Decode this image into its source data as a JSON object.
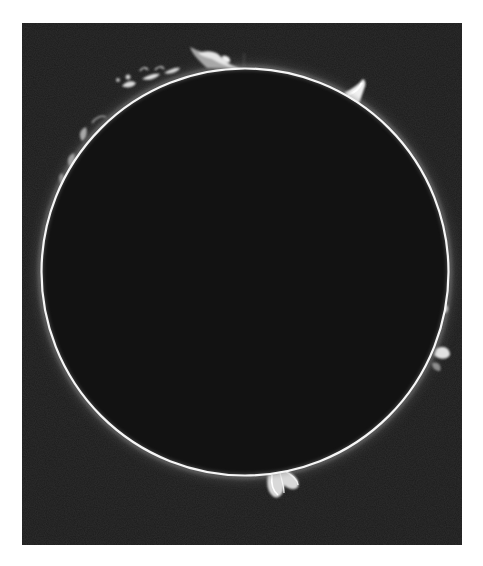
{
  "image": {
    "subject": "Solar disk with limb prominences",
    "alt": "Black-and-white photograph of the Sun's disk as a dark circle outlined by a bright thin limb, with several bright prominences erupting from the edge"
  },
  "colors": {
    "page_background": "#ffffff",
    "sky_background": "#1c1c1c",
    "disk_fill": "#111111",
    "limb": "#f4f4f4",
    "prominence": "#e8e8e8"
  },
  "geometry": {
    "frame": {
      "x": 22,
      "y": 23,
      "width": 440,
      "height": 522
    },
    "disk": {
      "cx": 223,
      "cy": 249,
      "r": 203
    }
  },
  "prominences": [
    {
      "name": "top-left-plume",
      "position": "upper limb near top, left of center"
    },
    {
      "name": "upper-right-spike",
      "position": "upper-right limb"
    },
    {
      "name": "upper-left-arc-cluster",
      "position": "upper-left limb"
    },
    {
      "name": "right-limb-loops",
      "position": "right limb, lower half"
    },
    {
      "name": "bottom-loop",
      "position": "bottom limb, slightly right of center"
    }
  ]
}
